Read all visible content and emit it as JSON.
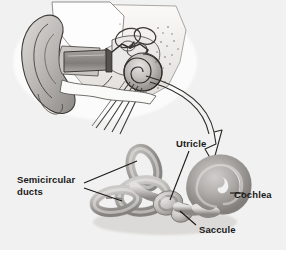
{
  "figure": {
    "background_color": "#f2f2f2",
    "width": 286,
    "height": 258
  },
  "labels": {
    "semicircular_ducts": "Semicircular\nducts",
    "utricle": "Utricle",
    "cochlea": "Cochlea",
    "saccule": "Saccule"
  },
  "illustrations": {
    "upper": {
      "name": "cross-section-of-ear",
      "parts": [
        "pinna",
        "ear-canal",
        "eardrum",
        "ossicles",
        "cochlea",
        "temporal-bone"
      ]
    },
    "lower": {
      "name": "membranous-labyrinth",
      "parts": [
        "semicircular-ducts",
        "utricle",
        "saccule",
        "cochlea"
      ]
    }
  },
  "connector": {
    "name": "magnification-arrow",
    "style": "outlined-curved-arrow",
    "from": "upper cochlea",
    "to": "lower labyrinth"
  },
  "colors": {
    "background": "#f2f2f2",
    "ink": "#1a1a1a",
    "tissue_light": "#e2e0de",
    "tissue_mid": "#b9b6b3",
    "tissue_dark": "#8d8a87",
    "shadow": "#6a6765"
  }
}
